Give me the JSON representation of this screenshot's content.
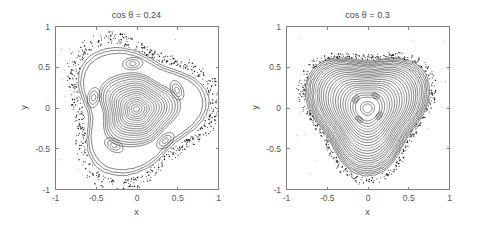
{
  "figure": {
    "background_color": "#ffffff",
    "axis_color": "#808080",
    "curve_color": "#1c1c1c",
    "width": 486,
    "height": 239
  },
  "panels": [
    {
      "id": "left",
      "title": "cos θ = 0.24",
      "xlabel": "x",
      "ylabel": "y"
    },
    {
      "id": "right",
      "title": "cos θ = 0.3",
      "xlabel": "x",
      "ylabel": "y"
    }
  ],
  "chart_data": [
    {
      "type": "scatter",
      "title": "cos θ = 0.24",
      "xlabel": "x",
      "ylabel": "y",
      "xlim": [
        -1,
        1
      ],
      "ylim": [
        -1,
        1
      ],
      "xticks": [
        -1,
        -0.5,
        0,
        0.5,
        1
      ],
      "xticklabels": [
        "-1",
        "-0.5",
        "0",
        "0.5",
        "1"
      ],
      "yticks": [
        -1,
        -0.5,
        0,
        0.5,
        1
      ],
      "yticklabels": [
        "-1",
        "-0.5",
        "0",
        "0.5",
        "1"
      ],
      "grid": false,
      "legend": false,
      "description": "Poincare surface of section: nested invariant tori about a central elliptic fixed point, five surrounding island chains, enclosed by a chaotic scattered boundary layer.",
      "series": [
        {
          "name": "core-tori",
          "kind": "nested-closed-curves",
          "center": [
            0.0,
            -0.02
          ],
          "count": 17,
          "radii": [
            0.035,
            0.062,
            0.09,
            0.115,
            0.14,
            0.165,
            0.19,
            0.215,
            0.242,
            0.268,
            0.295,
            0.32,
            0.345,
            0.372,
            0.4,
            0.425,
            0.45
          ],
          "aspect": 1.06,
          "deform_m3": 0.11,
          "deform_m5": 0.04,
          "rotation_deg": -8
        },
        {
          "name": "island-chain",
          "kind": "islands",
          "island_count": 5,
          "chain_radius": 0.54,
          "chain_phase_deg": 95,
          "island_rx": 0.125,
          "island_ry": 0.075,
          "rings_per_island": 3
        },
        {
          "name": "outer-tori",
          "kind": "nested-closed-curves",
          "center": [
            0.0,
            -0.02
          ],
          "count": 3,
          "radii": [
            0.68,
            0.715,
            0.745
          ],
          "aspect": 1.0,
          "deform_m3": 0.17,
          "deform_m5": 0.03,
          "rotation_deg": -8
        },
        {
          "name": "chaotic-sea",
          "kind": "scatter-band",
          "points": 620,
          "band_inner": 0.78,
          "band_outer": 0.92,
          "deform_m3": 0.17,
          "rotation_deg": -8
        },
        {
          "name": "stray-specks",
          "kind": "scatter-sparse",
          "points": 34
        }
      ]
    },
    {
      "type": "scatter",
      "title": "cos θ = 0.3",
      "xlabel": "x",
      "ylabel": "y",
      "xlim": [
        -1,
        1
      ],
      "ylim": [
        -1,
        1
      ],
      "xticks": [
        -1,
        -0.5,
        0,
        0.5,
        1
      ],
      "xticklabels": [
        "-1",
        "-0.5",
        "0",
        "0.5",
        "1"
      ],
      "yticks": [
        -1,
        -0.5,
        0,
        0.5,
        1
      ],
      "yticklabels": [
        "-1",
        "-0.5",
        "0",
        "0.5",
        "1"
      ],
      "grid": false,
      "legend": false,
      "description": "Poincare surface of section: densely nested rounded-triangular invariant tori about a central fixed point, a small four-island chain near the core, bounded by a thin chaotic scattered layer.",
      "series": [
        {
          "name": "core-tori",
          "kind": "nested-closed-curves",
          "center": [
            0.0,
            -0.01
          ],
          "count": 26,
          "radii": [
            0.055,
            0.085,
            0.145,
            0.175,
            0.205,
            0.235,
            0.262,
            0.29,
            0.318,
            0.345,
            0.372,
            0.4,
            0.425,
            0.45,
            0.475,
            0.5,
            0.525,
            0.548,
            0.57,
            0.592,
            0.612,
            0.632,
            0.652,
            0.67,
            0.688,
            0.705
          ],
          "aspect": 1.02,
          "deform_m3": 0.16,
          "deform_m5": 0.015,
          "rotation_deg": 90
        },
        {
          "name": "island-chain",
          "kind": "islands",
          "island_count": 4,
          "chain_radius": 0.175,
          "chain_phase_deg": 55,
          "island_rx": 0.05,
          "island_ry": 0.032,
          "rings_per_island": 2
        },
        {
          "name": "chaotic-sea",
          "kind": "scatter-band",
          "points": 460,
          "band_inner": 0.725,
          "band_outer": 0.8,
          "deform_m3": 0.16,
          "rotation_deg": 90
        },
        {
          "name": "stray-specks",
          "kind": "scatter-sparse",
          "points": 22
        }
      ]
    }
  ],
  "layout": {
    "plots": [
      {
        "x": 55,
        "y": 26,
        "w": 163,
        "h": 163
      },
      {
        "x": 286,
        "y": 26,
        "w": 163,
        "h": 163
      }
    ]
  }
}
